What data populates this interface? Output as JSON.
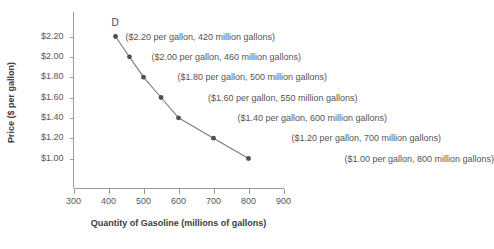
{
  "chart_data": {
    "type": "line",
    "title": "",
    "xlabel": "Quantity of Gasoline (millions of gallons)",
    "ylabel": "Price ($ per gallon)",
    "xlim": [
      300,
      900
    ],
    "ylim": [
      1.0,
      2.2
    ],
    "grid": false,
    "legend": "none",
    "curve_label": "D",
    "series": [
      {
        "name": "D",
        "x": [
          420,
          460,
          500,
          550,
          600,
          700,
          800
        ],
        "y": [
          2.2,
          2.0,
          1.8,
          1.6,
          1.4,
          1.2,
          1.0
        ]
      }
    ],
    "x_ticks": [
      "300",
      "400",
      "500",
      "600",
      "700",
      "800",
      "900"
    ],
    "x_tick_values": [
      300,
      400,
      500,
      600,
      700,
      800,
      900
    ],
    "y_ticks": [
      "$1.00",
      "$1.20",
      "$1.40",
      "$1.60",
      "$1.80",
      "$2.00",
      "$2.20"
    ],
    "y_tick_values": [
      1.0,
      1.2,
      1.4,
      1.6,
      1.8,
      2.0,
      2.2
    ],
    "annotations": [
      "($2.20 per gallon, 420 million gallons)",
      "($2.00 per gallon, 460 million gallons)",
      "($1.80 per gallon, 500 million gallons)",
      "($1.60 per gallon, 550 million gallons)",
      "($1.40 per gallon, 600 million gallons)",
      "($1.20 per gallon, 700 million gallons)",
      "($1.00 per gallon, 800 million gallons)"
    ],
    "colors": {
      "line": "#7c7c7c",
      "marker": "#4f4f4f",
      "axis": "#9a9a9a",
      "text": "#555555",
      "background": "#ffffff"
    }
  }
}
